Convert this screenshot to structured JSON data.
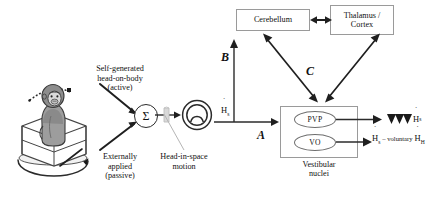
{
  "diagram": {
    "stimulus": {
      "active_label_line1": "Self-generated",
      "active_label_line2": "head-on-body",
      "active_label_line3": "(active)",
      "passive_label_line1": "Externally",
      "passive_label_line2": "applied",
      "passive_label_line3": "(passive)",
      "subject_icon": "monkey-in-box-on-turntable-icon",
      "rotation_icon": "circular-rotation-arrow-icon",
      "head_rotation_icon": "dotted-arc-arrow-icon"
    },
    "summing_junction": {
      "symbol": "Σ",
      "icon": "sigma-summing-junction-icon"
    },
    "canal": {
      "icon": "semicircular-canal-icon",
      "callout_line1": "Head-in-space",
      "callout_line2": "motion",
      "pointer_icon": "gray-arrow-pointer-icon"
    },
    "signals": {
      "head_in_space": "H",
      "head_in_space_sub": "s",
      "head_on_body": "H",
      "head_on_body_sub": "H"
    },
    "boxes": {
      "cerebellum": "Cerebellum",
      "thalamus_cortex_line1": "Thalamus /",
      "thalamus_cortex_line2": "Cortex",
      "vestibular_line1": "Vestibular",
      "vestibular_line2": "nuclei"
    },
    "neurons": {
      "pvp": "PVP",
      "vo": "VO"
    },
    "pathways": {
      "a": "A",
      "b": "B",
      "c": "C"
    },
    "outputs": {
      "pvp_output_prefix_icon": "three-down-triangles-icon",
      "pvp_output": "H",
      "pvp_output_sub": "s",
      "vo_output_minus": "– voluntary"
    },
    "colors": {
      "line": "#2b2b2b",
      "box_border": "#9a9a9a",
      "ellipse_border": "#6f6f6f",
      "accent_gray": "#b9b9b9",
      "text": "#111111"
    }
  }
}
